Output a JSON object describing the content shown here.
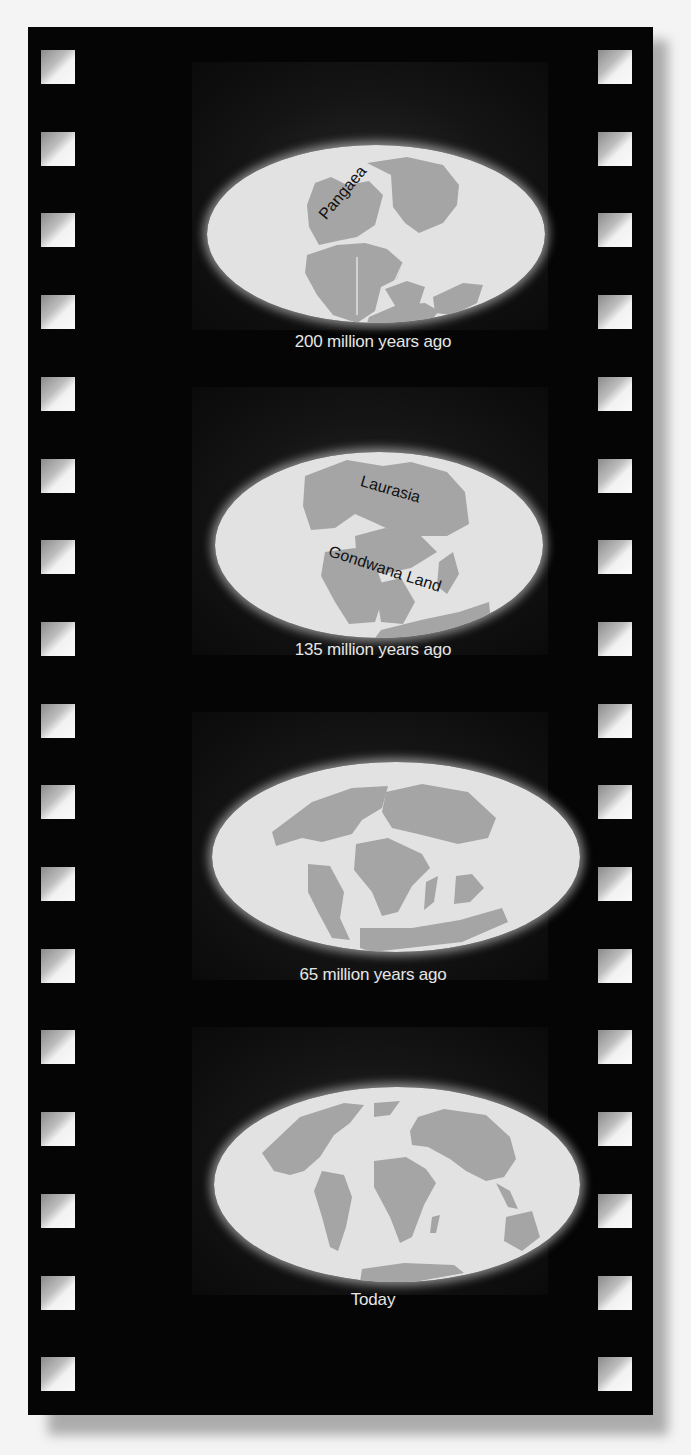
{
  "figure": {
    "colors": {
      "film": "#050505",
      "ocean": "#e2e2e2",
      "land": "#a5a5a5",
      "caption_text": "#e6e6e6",
      "label_text": "#111111",
      "background": "#f4f4f4"
    },
    "frames": [
      {
        "caption": "200 million years ago",
        "labels": [
          {
            "text": "Pangaea"
          }
        ]
      },
      {
        "caption": "135 million years ago",
        "labels": [
          {
            "text": "Laurasia"
          },
          {
            "text": "Gondwana Land"
          }
        ]
      },
      {
        "caption": "65 million years ago",
        "labels": []
      },
      {
        "caption": "Today",
        "labels": []
      }
    ],
    "sprocket_holes": {
      "per_side": 17
    }
  }
}
